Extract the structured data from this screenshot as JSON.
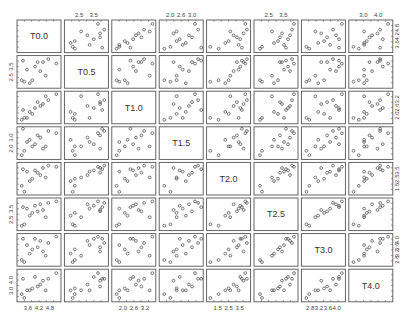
{
  "chart_data": {
    "type": "scatter",
    "subtype": "scatterplot_matrix",
    "title": "",
    "variables": [
      "T0.0",
      "T0.5",
      "T1.0",
      "T1.5",
      "T2.0",
      "T2.5",
      "T3.0",
      "T4.0"
    ],
    "grid": false,
    "layout": {
      "left": 17,
      "top": 20,
      "panel_w": 44,
      "panel_h": 32.6,
      "gap_x": 3.4,
      "gap_y": 3.0
    },
    "axes": {
      "top": [
        {
          "col": 1,
          "ticks": [
            "2.5",
            "3.5"
          ]
        },
        {
          "col": 3,
          "ticks": [
            "2.0",
            "2.6",
            "3.0"
          ]
        },
        {
          "col": 5,
          "ticks": [
            "2.5",
            "3.5"
          ]
        },
        {
          "col": 7,
          "ticks": [
            "3.0",
            "4.0"
          ]
        }
      ],
      "bottom": [
        {
          "col": 0,
          "ticks": [
            "3.6",
            "4.2",
            "4.8"
          ]
        },
        {
          "col": 2,
          "ticks": [
            "2.0",
            "2.6",
            "3.2"
          ]
        },
        {
          "col": 4,
          "ticks": [
            "1.5",
            "2.5",
            "3.5"
          ]
        },
        {
          "col": 6,
          "ticks": [
            "2.8",
            "3.2",
            "3.6",
            "4.0"
          ]
        }
      ],
      "left": [
        {
          "row": 1,
          "ticks": [
            "2.5",
            "3.5"
          ]
        },
        {
          "row": 3,
          "ticks": [
            "2.0",
            "3.0"
          ]
        },
        {
          "row": 5,
          "ticks": [
            "2.5",
            "3.5"
          ]
        },
        {
          "row": 7,
          "ticks": [
            "3.0",
            "4.0"
          ]
        }
      ],
      "right": [
        {
          "row": 0,
          "ticks": [
            "3.6",
            "4.2",
            "4.8"
          ]
        },
        {
          "row": 2,
          "ticks": [
            "2.0",
            "2.6",
            "3.2"
          ]
        },
        {
          "row": 4,
          "ticks": [
            "1.5",
            "2.5",
            "3.5"
          ]
        },
        {
          "row": 6,
          "ticks": [
            "2.8",
            "3.2",
            "3.6",
            "4.0"
          ]
        }
      ]
    },
    "observations": [
      [
        3.7,
        2.3,
        2.1,
        2.2,
        1.5,
        2.2,
        2.8,
        3.0
      ],
      [
        4.1,
        3.3,
        2.6,
        2.5,
        3.3,
        3.5,
        3.9,
        4.1
      ],
      [
        3.9,
        2.2,
        2.4,
        2.7,
        2.4,
        2.8,
        3.2,
        3.4
      ],
      [
        4.6,
        3.8,
        3.0,
        3.1,
        3.7,
        3.7,
        3.7,
        4.0
      ],
      [
        4.2,
        3.6,
        2.9,
        2.9,
        3.1,
        3.1,
        3.5,
        3.6
      ],
      [
        3.6,
        2.4,
        2.0,
        2.0,
        2.0,
        2.1,
        2.9,
        3.2
      ],
      [
        4.4,
        3.6,
        2.8,
        2.3,
        3.5,
        3.2,
        3.3,
        3.9
      ],
      [
        4.9,
        3.5,
        3.3,
        3.0,
        3.6,
        3.8,
        4.0,
        4.3
      ],
      [
        4.0,
        2.4,
        2.3,
        2.4,
        2.6,
        3.0,
        3.4,
        3.5
      ],
      [
        3.8,
        3.1,
        2.1,
        2.6,
        3.2,
        3.3,
        3.6,
        3.4
      ],
      [
        4.3,
        3.0,
        2.7,
        2.8,
        2.9,
        3.6,
        3.8,
        3.7
      ],
      [
        4.5,
        2.7,
        3.2,
        2.4,
        2.7,
        2.7,
        3.1,
        3.4
      ],
      [
        3.65,
        3.7,
        2.5,
        3.2,
        3.4,
        3.4,
        3.9,
        4.0
      ]
    ],
    "ranges": [
      [
        3.5,
        5.0
      ],
      [
        2.0,
        3.9
      ],
      [
        1.9,
        3.35
      ],
      [
        1.9,
        3.2
      ],
      [
        1.4,
        3.8
      ],
      [
        1.9,
        3.9
      ],
      [
        2.7,
        4.05
      ],
      [
        2.9,
        4.4
      ]
    ]
  }
}
